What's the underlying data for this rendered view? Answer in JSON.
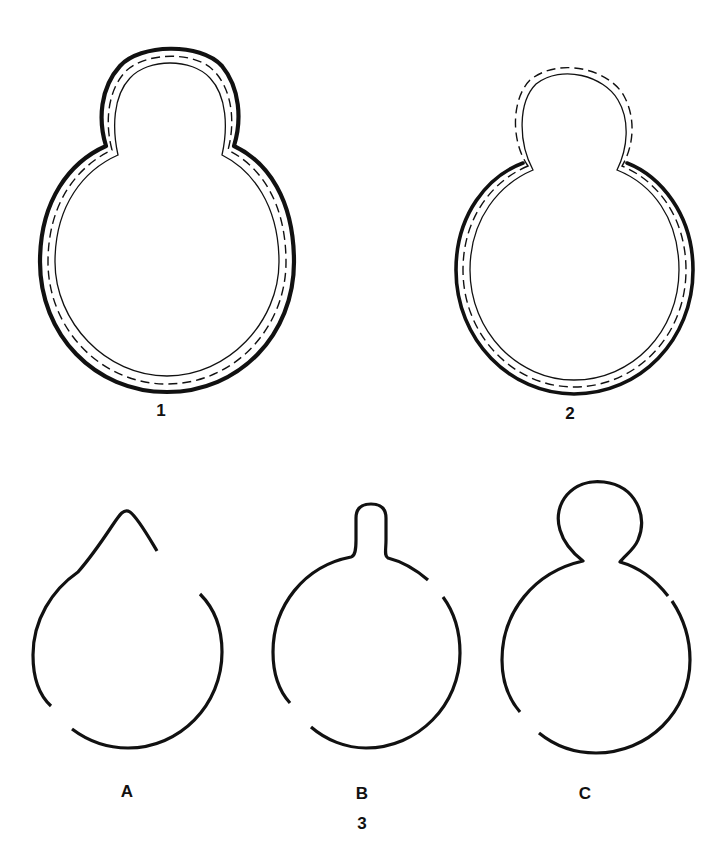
{
  "figure": {
    "panels": [
      {
        "id": "1",
        "label": "1",
        "description": "Budding cell with thick outer wall continuous around mother cell and bud"
      },
      {
        "id": "2",
        "label": "2",
        "description": "Budding cell with thick outer wall on mother cell only; bud covered by thin layers"
      }
    ],
    "group3": {
      "label": "3",
      "stages": [
        {
          "id": "A",
          "label": "A",
          "description": "Initial protrusion on cell surface"
        },
        {
          "id": "B",
          "label": "B",
          "description": "Narrow tubular outgrowth"
        },
        {
          "id": "C",
          "label": "C",
          "description": "Rounded bud attached to mother cell"
        }
      ]
    }
  }
}
